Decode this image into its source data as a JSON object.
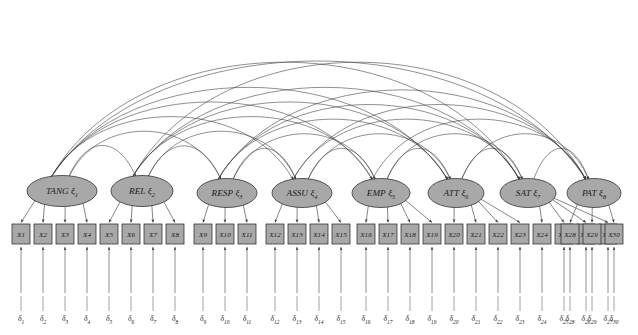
{
  "figure": {
    "kind": "path-diagram",
    "model_type": "confirmatory-factor-analysis",
    "notation": {
      "latent_symbol": "ξ",
      "indicator_prefix": "X",
      "error_symbol": "δ"
    },
    "counts": {
      "latent_factors": 8,
      "indicators": 30,
      "errors": 30,
      "covariance_arcs": 28
    }
  },
  "colors": {
    "node_fill": "#a8a8a8",
    "node_stroke": "#2b2b2b",
    "edge": "#3a3a3a",
    "background": "#ffffff",
    "text": "#1a1a1a"
  },
  "factors": [
    {
      "id": "TANG",
      "name": "TANG",
      "sub": "1",
      "cx": 62,
      "cy": 191,
      "rx": 35,
      "ry": 15.5,
      "indicators": [
        "X1",
        "X2",
        "X3",
        "X4"
      ]
    },
    {
      "id": "REL",
      "name": "REL",
      "sub": "2",
      "cx": 142,
      "cy": 191,
      "rx": 31,
      "ry": 15.5,
      "indicators": [
        "X5",
        "X6",
        "X7",
        "X8"
      ]
    },
    {
      "id": "RESP",
      "name": "RESP",
      "sub": "3",
      "cx": 227,
      "cy": 193,
      "rx": 30,
      "ry": 14.5,
      "indicators": [
        "X9",
        "X10",
        "X11"
      ]
    },
    {
      "id": "ASSU",
      "name": "ASSU",
      "sub": "4",
      "cx": 302,
      "cy": 193,
      "rx": 30,
      "ry": 14.5,
      "indicators": [
        "X12",
        "X13",
        "X14",
        "X15"
      ]
    },
    {
      "id": "EMP",
      "name": "EMP",
      "sub": "5",
      "cx": 381,
      "cy": 193,
      "rx": 29,
      "ry": 14.5,
      "indicators": [
        "X16",
        "X17",
        "X18",
        "X19"
      ]
    },
    {
      "id": "ATT",
      "name": "ATT",
      "sub": "6",
      "cx": 456,
      "cy": 193,
      "rx": 28,
      "ry": 14.5,
      "indicators": [
        "X20",
        "X21",
        "X22",
        "X23"
      ]
    },
    {
      "id": "SAT",
      "name": "SAT",
      "sub": "7",
      "cx": 528,
      "cy": 193,
      "rx": 28,
      "ry": 14.5,
      "indicators": [
        "X24",
        "X25",
        "X26",
        "X27"
      ]
    },
    {
      "id": "PAT",
      "name": "PAT",
      "sub": "8",
      "cx": 594,
      "cy": 193,
      "rx": 27,
      "ry": 14.5,
      "indicators": [
        "X28",
        "X29",
        "X30"
      ]
    }
  ],
  "indicators": [
    {
      "label": "X1",
      "x": 21,
      "error": "1"
    },
    {
      "label": "X2",
      "x": 43,
      "error": "2"
    },
    {
      "label": "X3",
      "x": 65,
      "error": "3"
    },
    {
      "label": "X4",
      "x": 87,
      "error": "4"
    },
    {
      "label": "X5",
      "x": 109,
      "error": "5"
    },
    {
      "label": "X6",
      "x": 131,
      "error": "6"
    },
    {
      "label": "X7",
      "x": 153,
      "error": "7"
    },
    {
      "label": "X8",
      "x": 175,
      "error": "8"
    },
    {
      "label": "X9",
      "x": 203,
      "error": "9"
    },
    {
      "label": "X10",
      "x": 225,
      "error": "10"
    },
    {
      "label": "X11",
      "x": 247,
      "error": "11"
    },
    {
      "label": "X12",
      "x": 275,
      "error": "12"
    },
    {
      "label": "X13",
      "x": 297,
      "error": "13"
    },
    {
      "label": "X14",
      "x": 319,
      "error": "14"
    },
    {
      "label": "X15",
      "x": 341,
      "error": "15"
    },
    {
      "label": "X16",
      "x": 366,
      "error": "16"
    },
    {
      "label": "X17",
      "x": 388,
      "error": "17"
    },
    {
      "label": "X18",
      "x": 410,
      "error": "18"
    },
    {
      "label": "X19",
      "x": 432,
      "error": "19"
    },
    {
      "label": "X20",
      "x": 454,
      "error": "20"
    },
    {
      "label": "X21",
      "x": 476,
      "error": "21"
    },
    {
      "label": "X22",
      "x": 498,
      "error": "22"
    },
    {
      "label": "X23",
      "x": 520,
      "error": "23"
    },
    {
      "label": "X24",
      "x": 542,
      "error": "24"
    },
    {
      "label": "X25",
      "x": 564,
      "error": "25"
    },
    {
      "label": "X26",
      "x": 586,
      "error": "26"
    },
    {
      "label": "X27",
      "x": 608,
      "error": "27"
    },
    {
      "label": "X28",
      "x": 570,
      "error": "28"
    },
    {
      "label": "X29",
      "x": 592,
      "error": "29"
    },
    {
      "label": "X30",
      "x": 614,
      "error": "30"
    }
  ],
  "layout": {
    "box": {
      "w": 18,
      "h": 20,
      "y": 224
    },
    "error_label_y": 321,
    "error_stub_top": 296,
    "error_stub_bottom": 311,
    "arrow_from_error_top": 247,
    "arrow_from_error_bottom": 293
  }
}
